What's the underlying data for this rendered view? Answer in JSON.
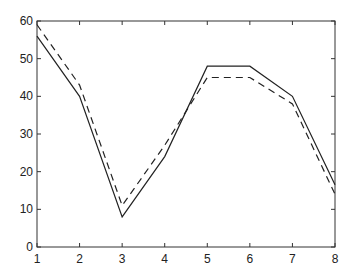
{
  "chart_data": {
    "type": "line",
    "title": "",
    "xlabel": "",
    "ylabel": "",
    "x": [
      1,
      2,
      3,
      4,
      5,
      6,
      7,
      8
    ],
    "xlim": [
      1,
      8
    ],
    "ylim": [
      0,
      60
    ],
    "xticks": [
      "1",
      "2",
      "3",
      "4",
      "5",
      "6",
      "7",
      "8"
    ],
    "yticks": [
      "0",
      "10",
      "20",
      "30",
      "40",
      "50",
      "60"
    ],
    "grid": false,
    "legend": null,
    "series": [
      {
        "name": "solid",
        "style": "solid",
        "color": "#222222",
        "values": [
          56,
          40,
          8,
          24,
          48,
          48,
          40,
          16.5
        ]
      },
      {
        "name": "dashed",
        "style": "dashed",
        "color": "#222222",
        "values": [
          59,
          43,
          11,
          27,
          45,
          45,
          38,
          14
        ]
      }
    ]
  },
  "layout": {
    "plot_left": 37,
    "plot_right": 335,
    "plot_top": 21,
    "plot_bottom": 247
  }
}
